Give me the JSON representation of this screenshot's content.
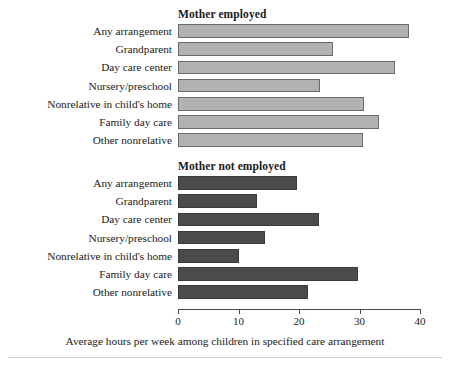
{
  "chart_data": {
    "type": "bar",
    "orientation": "horizontal",
    "title": "",
    "xlabel": "Average hours per week among children in specified care arrangement",
    "ylabel": "",
    "xlim": [
      0,
      40
    ],
    "xticks": [
      0,
      10,
      20,
      30,
      40
    ],
    "xtick_labels": [
      "0",
      "10",
      "20",
      "30",
      "40"
    ],
    "grid": false,
    "legend": "none",
    "categories": [
      "Any arrangement",
      "Grandparent",
      "Day care center",
      "Nursery/preschool",
      "Nonrelative in child's home",
      "Family day care",
      "Other nonrelative"
    ],
    "panels": [
      {
        "title": "Mother employed",
        "color": "#b2b2b2",
        "values": [
          38.2,
          25.7,
          35.8,
          23.5,
          30.7,
          33.2,
          30.6
        ]
      },
      {
        "title": "Mother not employed",
        "color": "#4b4b4b",
        "values": [
          19.6,
          13.1,
          23.3,
          14.4,
          10.1,
          29.8,
          21.5
        ]
      }
    ]
  }
}
